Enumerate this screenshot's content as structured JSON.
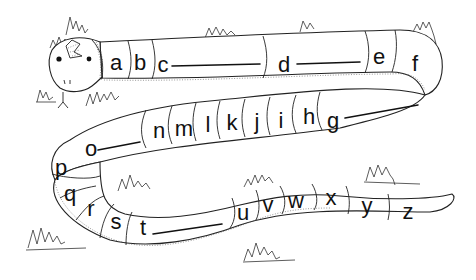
{
  "worksheet": {
    "subject": "snake-alphabet",
    "letters": [
      {
        "char": "a",
        "x": 116,
        "y": 64
      },
      {
        "char": "b",
        "x": 140,
        "y": 64
      },
      {
        "char": "c",
        "x": 163,
        "y": 66
      },
      {
        "char": "d",
        "x": 284,
        "y": 66
      },
      {
        "char": "e",
        "x": 379,
        "y": 58
      },
      {
        "char": "f",
        "x": 415,
        "y": 65
      },
      {
        "char": "g",
        "x": 333,
        "y": 122
      },
      {
        "char": "h",
        "x": 309,
        "y": 118
      },
      {
        "char": "i",
        "x": 281,
        "y": 122
      },
      {
        "char": "j",
        "x": 257,
        "y": 123
      },
      {
        "char": "k",
        "x": 232,
        "y": 124
      },
      {
        "char": "l",
        "x": 208,
        "y": 126
      },
      {
        "char": "m",
        "x": 184,
        "y": 130
      },
      {
        "char": "n",
        "x": 159,
        "y": 132
      },
      {
        "char": "o",
        "x": 91,
        "y": 150
      },
      {
        "char": "p",
        "x": 61,
        "y": 169
      },
      {
        "char": "q",
        "x": 70,
        "y": 195
      },
      {
        "char": "r",
        "x": 91,
        "y": 210
      },
      {
        "char": "s",
        "x": 116,
        "y": 223
      },
      {
        "char": "t",
        "x": 143,
        "y": 229
      },
      {
        "char": "u",
        "x": 243,
        "y": 214
      },
      {
        "char": "v",
        "x": 268,
        "y": 206
      },
      {
        "char": "w",
        "x": 296,
        "y": 202
      },
      {
        "char": "x",
        "x": 331,
        "y": 199
      },
      {
        "char": "y",
        "x": 367,
        "y": 207
      },
      {
        "char": "z",
        "x": 408,
        "y": 213
      }
    ],
    "blank_lines_after": [
      "c",
      "d",
      "g",
      "o",
      "t"
    ]
  }
}
